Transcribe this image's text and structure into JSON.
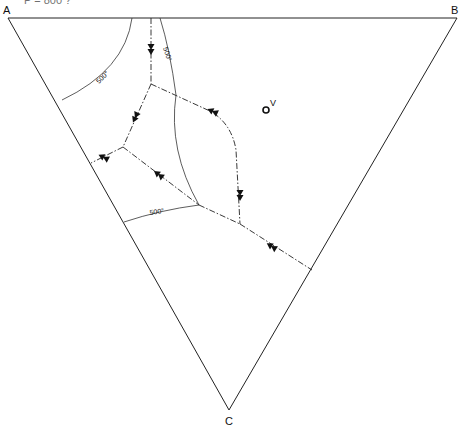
{
  "header": {
    "partial_text": "P = 800 ?"
  },
  "vertices": {
    "A": {
      "label": "A"
    },
    "B": {
      "label": "B"
    },
    "C": {
      "label": "C"
    }
  },
  "point_v": {
    "label": "V"
  },
  "isotherms": [
    {
      "label": "500°"
    },
    {
      "label": "500°"
    },
    {
      "label": "500°"
    }
  ]
}
